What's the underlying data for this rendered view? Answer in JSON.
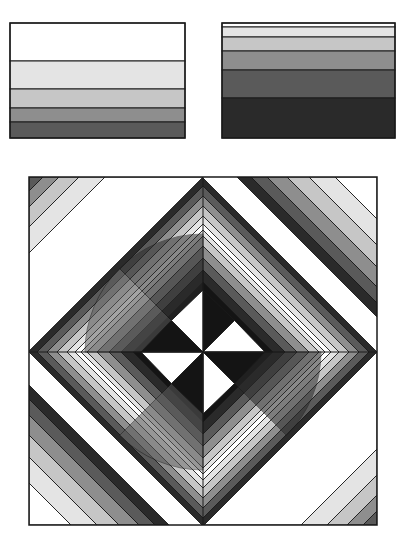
{
  "palette": {
    "white": "#ffffff",
    "light": "#e4e4e4",
    "medlight": "#c6c6c6",
    "medium": "#8e8e8e",
    "darkmed": "#5a5a5a",
    "dark": "#2a2a2a",
    "black": "#141414",
    "stroke": "#1a1a1a"
  },
  "swatches": [
    {
      "name": "swatch-left",
      "x": 10,
      "y": 23,
      "width": 175,
      "height": 115,
      "bands": [
        {
          "y": 23,
          "h": 38,
          "fill": "white"
        },
        {
          "y": 61,
          "h": 28,
          "fill": "light"
        },
        {
          "y": 89,
          "h": 19,
          "fill": "medlight"
        },
        {
          "y": 108,
          "h": 14,
          "fill": "medium"
        },
        {
          "y": 122,
          "h": 16,
          "fill": "darkmed"
        }
      ]
    },
    {
      "name": "swatch-right",
      "x": 222,
      "y": 23,
      "width": 173,
      "height": 115,
      "bands": [
        {
          "y": 23,
          "h": 4,
          "fill": "white"
        },
        {
          "y": 27,
          "h": 10,
          "fill": "light"
        },
        {
          "y": 37,
          "h": 14,
          "fill": "medlight"
        },
        {
          "y": 51,
          "h": 19,
          "fill": "medium"
        },
        {
          "y": 70,
          "h": 28,
          "fill": "darkmed"
        },
        {
          "y": 98,
          "h": 40,
          "fill": "dark"
        }
      ]
    }
  ],
  "main_square": {
    "x": 29,
    "y": 177,
    "size": 348,
    "center": [
      203,
      352
    ],
    "corner_bands_ul": [
      "darkmed",
      "medium",
      "medlight",
      "light",
      "white"
    ],
    "corner_bands_ur": [
      "white",
      "light",
      "medlight",
      "medium",
      "darkmed",
      "dark"
    ],
    "pinwheel": [
      "black",
      "white",
      "black",
      "white",
      "black",
      "white",
      "black",
      "white"
    ]
  }
}
